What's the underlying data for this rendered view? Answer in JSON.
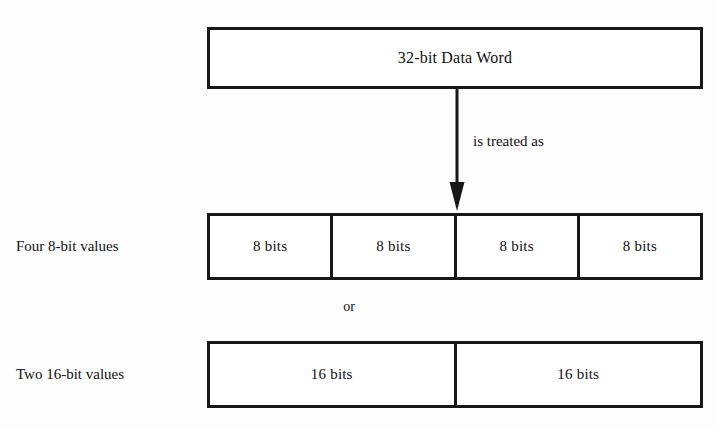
{
  "diagram": {
    "colors": {
      "stroke": "#171717",
      "fill": "#ffffff",
      "page_background": "#fdfdfd",
      "text": "#121212"
    },
    "top_word": {
      "label": "32-bit Data Word"
    },
    "arrow": {
      "caption": "is treated as",
      "direction": "down"
    },
    "connector": {
      "label": "or"
    },
    "rows": [
      {
        "caption": "Four 8-bit values",
        "cells": [
          {
            "label": "8 bits"
          },
          {
            "label": "8 bits"
          },
          {
            "label": "8 bits"
          },
          {
            "label": "8 bits"
          }
        ]
      },
      {
        "caption": "Two 16-bit values",
        "cells": [
          {
            "label": "16 bits"
          },
          {
            "label": "16 bits"
          }
        ]
      }
    ]
  }
}
